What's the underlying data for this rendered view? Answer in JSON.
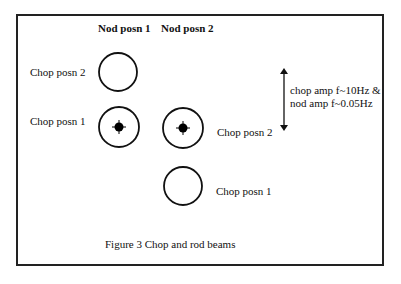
{
  "figure": {
    "caption": "Figure 3  Chop and rod beams",
    "column_headers": [
      "Nod posn 1",
      "Nod posn 2"
    ],
    "beams": [
      {
        "id": "nod1-chop2",
        "label": "Chop posn 2",
        "source": false
      },
      {
        "id": "nod1-chop1",
        "label": "Chop posn 1",
        "source": true
      },
      {
        "id": "nod2-chop2",
        "label": "Chop posn 2",
        "source": true
      },
      {
        "id": "nod2-chop1",
        "label": "Chop posn 1",
        "source": false
      }
    ],
    "arrow_annotation": {
      "line1": "chop amp f~10Hz &",
      "line2": "nod amp f~0.05Hz"
    }
  }
}
